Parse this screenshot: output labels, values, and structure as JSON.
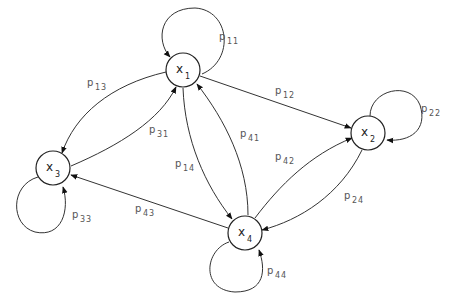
{
  "diagram": {
    "type": "markov-chain-state-transition",
    "nodes": [
      {
        "id": "x1",
        "label": "x",
        "sub": "1"
      },
      {
        "id": "x2",
        "label": "x",
        "sub": "2"
      },
      {
        "id": "x3",
        "label": "x",
        "sub": "3"
      },
      {
        "id": "x4",
        "label": "x",
        "sub": "4"
      }
    ],
    "edges": [
      {
        "from": "x1",
        "to": "x1",
        "label": "p",
        "sub": "11"
      },
      {
        "from": "x2",
        "to": "x2",
        "label": "p",
        "sub": "22"
      },
      {
        "from": "x3",
        "to": "x3",
        "label": "p",
        "sub": "33"
      },
      {
        "from": "x4",
        "to": "x4",
        "label": "p",
        "sub": "44"
      },
      {
        "from": "x1",
        "to": "x2",
        "label": "p",
        "sub": "12"
      },
      {
        "from": "x1",
        "to": "x3",
        "label": "p",
        "sub": "13"
      },
      {
        "from": "x3",
        "to": "x1",
        "label": "p",
        "sub": "31"
      },
      {
        "from": "x1",
        "to": "x4",
        "label": "p",
        "sub": "14"
      },
      {
        "from": "x4",
        "to": "x1",
        "label": "p",
        "sub": "41"
      },
      {
        "from": "x4",
        "to": "x2",
        "label": "p",
        "sub": "42"
      },
      {
        "from": "x2",
        "to": "x4",
        "label": "p",
        "sub": "24"
      },
      {
        "from": "x4",
        "to": "x3",
        "label": "p",
        "sub": "43"
      }
    ]
  },
  "colors": {
    "stroke": "#222222",
    "label": "#555555",
    "background": "#ffffff"
  }
}
